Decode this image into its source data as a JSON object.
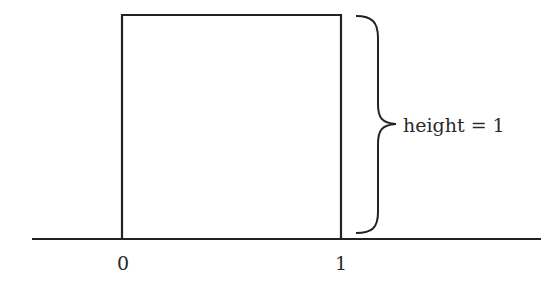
{
  "diagram": {
    "type": "uniform-distribution-box",
    "box": {
      "x_start": 0,
      "x_end": 1,
      "height": 1
    },
    "axis": {
      "tick_labels": [
        "0",
        "1"
      ]
    },
    "brace_label": "height = 1",
    "colors": {
      "stroke": "#222222",
      "text": "#2a2a2a",
      "background": "#ffffff"
    }
  }
}
